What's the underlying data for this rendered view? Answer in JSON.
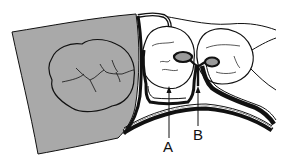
{
  "diagram": {
    "labels": [
      {
        "id": "A",
        "text": "A"
      },
      {
        "id": "B",
        "text": "B"
      }
    ],
    "colors": {
      "shaded_region": "#a9a9a9",
      "line": "#111111",
      "background": "#ffffff",
      "rest_fill": "#9a9a9a"
    }
  }
}
